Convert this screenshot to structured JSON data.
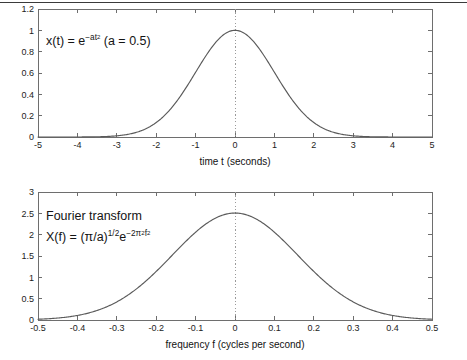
{
  "figure": {
    "background_color": "#ffffff",
    "curve_color": "#5a5a5a",
    "axis_color": "#6e6e6e",
    "marker_color": "#9a9a9a",
    "top_rule_visible": true
  },
  "panels": {
    "top": {
      "name": "gaussian-time-domain",
      "annotation": {
        "prefix": "x(t) = e",
        "exponent": "−at",
        "exponent_power": "2",
        "suffix": " (a = 0.5)",
        "full_text": "x(t) = e^(-at^2)  (a = 0.5)"
      },
      "xlabel": "time t (seconds)",
      "ylabel": "",
      "xticks": [
        "-5",
        "-4",
        "-3",
        "-2",
        "-1",
        "0",
        "1",
        "2",
        "3",
        "4",
        "5"
      ],
      "yticks": [
        "0",
        "0.2",
        "0.4",
        "0.6",
        "0.8",
        "1",
        "1.2"
      ],
      "marker_x": "0"
    },
    "bottom": {
      "name": "gaussian-frequency-domain",
      "annotation_title": "Fourier transform",
      "annotation": {
        "prefix": "X(f) = (π/a)",
        "power_half": "1/2",
        "e_base": "e",
        "exponent": "−2π",
        "exponent_pi_power": "2",
        "exponent_f": "f",
        "exponent_f_power": "2",
        "full_text": "X(f) = (pi/a)^(1/2) e^(-2 pi^2 f^2)"
      },
      "xlabel": "frequency f (cycles per second)",
      "ylabel": "",
      "xticks": [
        "-0.5",
        "-0.4",
        "-0.3",
        "-0.2",
        "-0.1",
        "0",
        "0.1",
        "0.2",
        "0.3",
        "0.4",
        "0.5"
      ],
      "yticks": [
        "0",
        "0.5",
        "1",
        "1.5",
        "2",
        "2.5",
        "3"
      ],
      "marker_x": "0"
    }
  },
  "chart_data": [
    {
      "type": "line",
      "name": "time-domain-gaussian",
      "title": "",
      "annotation": "x(t) = e^(-at^2) (a = 0.5)",
      "xlabel": "time t (seconds)",
      "ylabel": "",
      "xlim": [
        -5,
        5
      ],
      "ylim": [
        0,
        1.2
      ],
      "xticks": [
        -5,
        -4,
        -3,
        -2,
        -1,
        0,
        1,
        2,
        3,
        4,
        5
      ],
      "yticks": [
        0,
        0.2,
        0.4,
        0.6,
        0.8,
        1,
        1.2
      ],
      "grid": false,
      "legend": null,
      "formula": "exp(-0.5 * x^2)",
      "parameter_a": 0.5,
      "peak_value": 1.0,
      "peak_x": 0,
      "vline_at": 0,
      "x": [
        -5,
        -4.5,
        -4,
        -3.5,
        -3,
        -2.5,
        -2,
        -1.5,
        -1,
        -0.5,
        0,
        0.5,
        1,
        1.5,
        2,
        2.5,
        3,
        3.5,
        4,
        4.5,
        5
      ],
      "values": [
        3.73e-05,
        0.000363,
        0.000335,
        0.00219,
        0.0111,
        0.0439,
        0.1353,
        0.3247,
        0.6065,
        0.8825,
        1.0,
        0.8825,
        0.6065,
        0.3247,
        0.1353,
        0.0439,
        0.0111,
        0.00219,
        0.000335,
        3.63e-05,
        3.73e-05
      ]
    },
    {
      "type": "line",
      "name": "frequency-domain-gaussian",
      "title": "Fourier transform",
      "annotation": "X(f) = (pi/a)^(1/2) e^(-2 pi^2 f^2)",
      "xlabel": "frequency f (cycles per second)",
      "ylabel": "",
      "xlim": [
        -0.5,
        0.5
      ],
      "ylim": [
        0,
        3
      ],
      "xticks": [
        -0.5,
        -0.4,
        -0.3,
        -0.2,
        -0.1,
        0,
        0.1,
        0.2,
        0.3,
        0.4,
        0.5
      ],
      "yticks": [
        0,
        0.5,
        1,
        1.5,
        2,
        2.5,
        3
      ],
      "grid": false,
      "legend": null,
      "formula": "sqrt(pi/0.5) * exp(-2 * pi^2 * f^2)",
      "parameter_a": 0.5,
      "peak_value": 2.5066,
      "peak_x": 0,
      "vline_at": 0,
      "x": [
        -0.5,
        -0.45,
        -0.4,
        -0.35,
        -0.3,
        -0.25,
        -0.2,
        -0.15,
        -0.1,
        -0.05,
        0,
        0.05,
        0.1,
        0.15,
        0.2,
        0.25,
        0.3,
        0.35,
        0.4,
        0.45,
        0.5
      ],
      "values": [
        0.0019,
        0.005,
        0.0106,
        0.0286,
        0.0419,
        0.1423,
        0.1164,
        0.3305,
        0.3429,
        0.8828,
        2.5066,
        0.8828,
        0.3429,
        0.3305,
        0.1164,
        0.1423,
        0.0419,
        0.0286,
        0.0106,
        0.005,
        0.0019
      ]
    }
  ]
}
